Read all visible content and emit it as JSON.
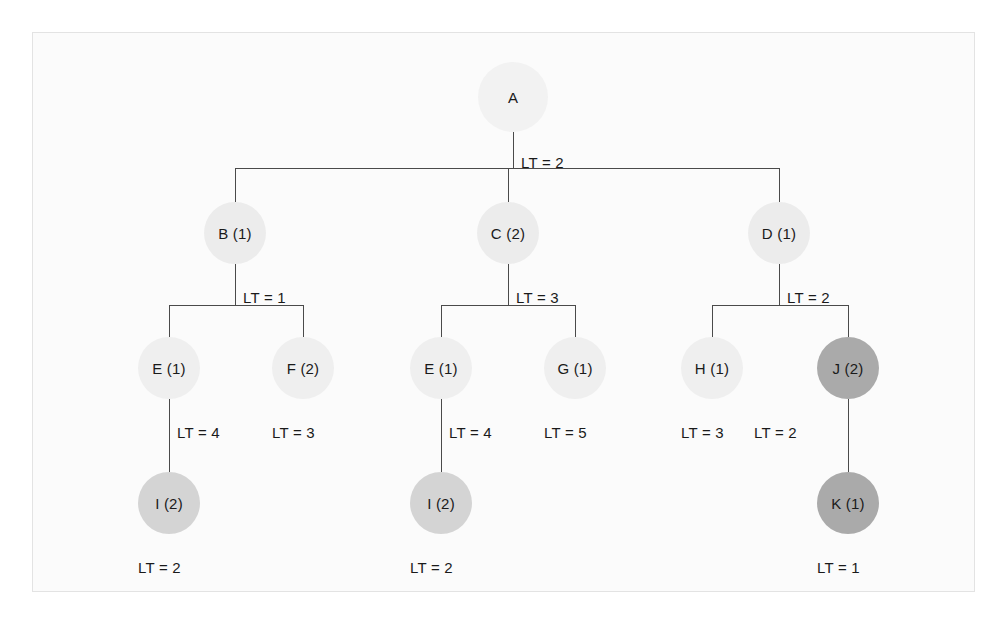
{
  "diagram": {
    "colors": {
      "background": "#ffffff",
      "panel": "#fbfbfb",
      "panel_border": "#e3e3e3",
      "edge": "#4a4a4a",
      "text": "#1a1a1a",
      "node_lightest": "#f2f2f2",
      "node_light": "#ececec",
      "node_medium": "#d4d4d4",
      "node_dark": "#aaaaaa"
    },
    "nodes": [
      {
        "id": "A",
        "label": "A",
        "x": 513,
        "y": 97,
        "r": 35,
        "shade": "#f2f2f2"
      },
      {
        "id": "B",
        "label": "B (1)",
        "x": 235,
        "y": 233,
        "r": 31,
        "shade": "#ececec"
      },
      {
        "id": "C",
        "label": "C (2)",
        "x": 508,
        "y": 233,
        "r": 31,
        "shade": "#ececec"
      },
      {
        "id": "D",
        "label": "D (1)",
        "x": 779,
        "y": 233,
        "r": 31,
        "shade": "#ececec"
      },
      {
        "id": "E1",
        "label": "E (1)",
        "x": 169,
        "y": 368,
        "r": 31,
        "shade": "#efefef"
      },
      {
        "id": "F",
        "label": "F (2)",
        "x": 303,
        "y": 368,
        "r": 31,
        "shade": "#efefef"
      },
      {
        "id": "E2",
        "label": "E (1)",
        "x": 441,
        "y": 368,
        "r": 31,
        "shade": "#efefef"
      },
      {
        "id": "G",
        "label": "G (1)",
        "x": 575,
        "y": 368,
        "r": 31,
        "shade": "#efefef"
      },
      {
        "id": "H",
        "label": "H (1)",
        "x": 712,
        "y": 368,
        "r": 31,
        "shade": "#efefef"
      },
      {
        "id": "J",
        "label": "J (2)",
        "x": 848,
        "y": 368,
        "r": 31,
        "shade": "#aaaaaa"
      },
      {
        "id": "I1",
        "label": "I (2)",
        "x": 169,
        "y": 503,
        "r": 31,
        "shade": "#d4d4d4"
      },
      {
        "id": "I2",
        "label": "I (2)",
        "x": 441,
        "y": 503,
        "r": 31,
        "shade": "#d4d4d4"
      },
      {
        "id": "K",
        "label": "K (1)",
        "x": 848,
        "y": 503,
        "r": 31,
        "shade": "#aaaaaa"
      }
    ],
    "lt_labels": [
      {
        "id": "lt-a",
        "text": "LT = 2",
        "x": 521,
        "y": 155
      },
      {
        "id": "lt-b",
        "text": "LT = 1",
        "x": 243,
        "y": 290
      },
      {
        "id": "lt-c",
        "text": "LT = 3",
        "x": 516,
        "y": 290
      },
      {
        "id": "lt-d",
        "text": "LT = 2",
        "x": 787,
        "y": 290
      },
      {
        "id": "lt-e1",
        "text": "LT = 4",
        "x": 177,
        "y": 425
      },
      {
        "id": "lt-f",
        "text": "LT = 3",
        "x": 272,
        "y": 425
      },
      {
        "id": "lt-e2",
        "text": "LT = 4",
        "x": 449,
        "y": 425
      },
      {
        "id": "lt-g",
        "text": "LT = 5",
        "x": 544,
        "y": 425
      },
      {
        "id": "lt-h",
        "text": "LT = 3",
        "x": 681,
        "y": 425
      },
      {
        "id": "lt-j",
        "text": "LT = 2",
        "x": 754,
        "y": 425
      },
      {
        "id": "lt-i1",
        "text": "LT = 2",
        "x": 138,
        "y": 560
      },
      {
        "id": "lt-i2",
        "text": "LT = 2",
        "x": 410,
        "y": 560
      },
      {
        "id": "lt-k",
        "text": "LT = 1",
        "x": 817,
        "y": 560
      }
    ],
    "edges": [
      {
        "id": "a-bus-stem",
        "type": "v",
        "x": 513,
        "y": 132,
        "len": 36
      },
      {
        "id": "a-bus",
        "type": "h",
        "x": 235,
        "y": 168,
        "len": 544
      },
      {
        "id": "a-to-b",
        "type": "v",
        "x": 235,
        "y": 168,
        "len": 34
      },
      {
        "id": "a-to-c",
        "type": "v",
        "x": 508,
        "y": 168,
        "len": 34
      },
      {
        "id": "a-to-d",
        "type": "v",
        "x": 779,
        "y": 168,
        "len": 34
      },
      {
        "id": "b-bus-stem",
        "type": "v",
        "x": 235,
        "y": 264,
        "len": 41
      },
      {
        "id": "b-bus",
        "type": "h",
        "x": 169,
        "y": 305,
        "len": 134
      },
      {
        "id": "b-to-e1",
        "type": "v",
        "x": 169,
        "y": 305,
        "len": 32
      },
      {
        "id": "b-to-f",
        "type": "v",
        "x": 303,
        "y": 305,
        "len": 32
      },
      {
        "id": "c-bus-stem",
        "type": "v",
        "x": 508,
        "y": 264,
        "len": 41
      },
      {
        "id": "c-bus",
        "type": "h",
        "x": 441,
        "y": 305,
        "len": 134
      },
      {
        "id": "c-to-e2",
        "type": "v",
        "x": 441,
        "y": 305,
        "len": 32
      },
      {
        "id": "c-to-g",
        "type": "v",
        "x": 575,
        "y": 305,
        "len": 32
      },
      {
        "id": "d-bus-stem",
        "type": "v",
        "x": 779,
        "y": 264,
        "len": 41
      },
      {
        "id": "d-bus",
        "type": "h",
        "x": 712,
        "y": 305,
        "len": 136
      },
      {
        "id": "d-to-h",
        "type": "v",
        "x": 712,
        "y": 305,
        "len": 32
      },
      {
        "id": "d-to-j",
        "type": "v",
        "x": 848,
        "y": 305,
        "len": 32
      },
      {
        "id": "e1-to-i1",
        "type": "v",
        "x": 169,
        "y": 399,
        "len": 73
      },
      {
        "id": "e2-to-i2",
        "type": "v",
        "x": 441,
        "y": 399,
        "len": 73
      },
      {
        "id": "j-to-k",
        "type": "v",
        "x": 848,
        "y": 399,
        "len": 73
      }
    ]
  }
}
